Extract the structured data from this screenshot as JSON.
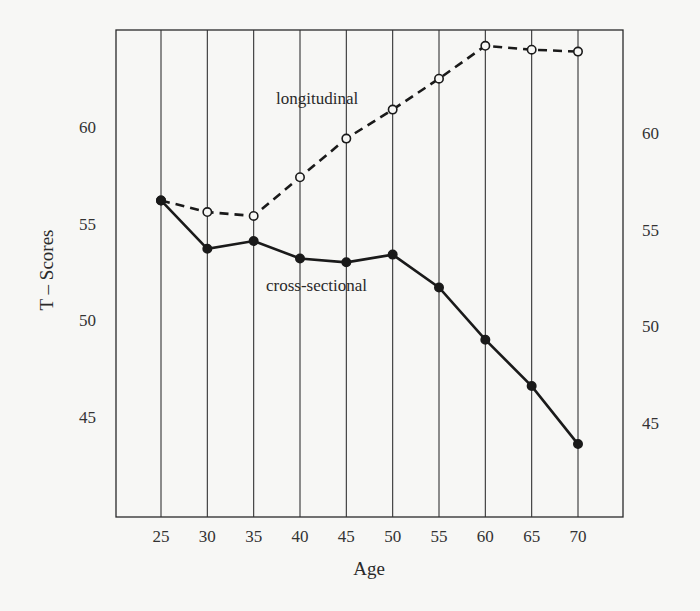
{
  "chart_data": {
    "type": "line",
    "title": "",
    "xlabel": "Age",
    "ylabel": "T – Scores",
    "x": [
      25,
      30,
      35,
      40,
      45,
      50,
      55,
      60,
      65,
      70
    ],
    "x_tick_labels": [
      "25",
      "30",
      "35",
      "40",
      "45",
      "50",
      "55",
      "60",
      "65",
      "70"
    ],
    "y_ticks_left": [
      60,
      55,
      50,
      45
    ],
    "y_ticks_right": [
      60,
      55,
      50,
      45
    ],
    "ylim": [
      40,
      65.2
    ],
    "xlim": [
      20.1,
      74.7
    ],
    "grid": {
      "vertical": true,
      "horizontal": false
    },
    "legend": "inline labels",
    "series": [
      {
        "name": "longitudinal",
        "style": "dashed",
        "marker": "open-circle",
        "values": [
          56.2,
          55.6,
          55.4,
          57.4,
          59.4,
          60.9,
          62.5,
          64.2,
          64.0,
          63.9
        ]
      },
      {
        "name": "cross-sectional",
        "style": "solid",
        "marker": "filled-circle",
        "values": [
          56.2,
          53.7,
          54.1,
          53.2,
          53.0,
          53.4,
          51.7,
          49.0,
          46.6,
          43.6
        ]
      }
    ],
    "annotations": [
      {
        "text": "longitudinal",
        "near_x": 45,
        "near_y": 61.4
      },
      {
        "text": "cross-sectional",
        "near_x": 45,
        "near_y": 52.0
      }
    ]
  },
  "labels": {
    "xlabel": "Age",
    "ylabel": "T – Scores",
    "longitudinal": "longitudinal",
    "cross_sectional": "cross-sectional"
  },
  "colors": {
    "ink": "#1a1a1a",
    "grid": "#333333",
    "background": "#f7f7f5"
  }
}
